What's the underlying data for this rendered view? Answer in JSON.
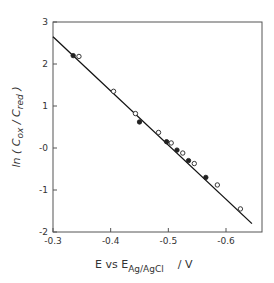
{
  "chart_data": {
    "type": "scatter",
    "title": "",
    "xlabel": "E vs E_Ag/AgCl / V",
    "xlabel_parts": {
      "main": "E  vs  E",
      "subscript": "Ag/AgCl",
      "unit": "/   V"
    },
    "ylabel": "ln ( C_ox / C_red )",
    "ylabel_parts": {
      "prefix": "ln ( C",
      "sub1": "ox",
      "mid": " / C",
      "sub2": "red",
      "suffix": " )"
    },
    "xlim": [
      -0.3,
      -0.65
    ],
    "ylim": [
      -2,
      3
    ],
    "x_ticks": [
      -0.3,
      -0.4,
      -0.5,
      -0.6
    ],
    "x_tick_labels": [
      "-0.3",
      "-0.4",
      "-0.5",
      "-0.6"
    ],
    "y_ticks": [
      3,
      2,
      1,
      0,
      -1,
      -2
    ],
    "y_tick_labels": [
      "3",
      "2",
      "1",
      "-0",
      "-1",
      "-2"
    ],
    "grid": false,
    "legend": null,
    "series": [
      {
        "name": "open circles",
        "marker": "open-circle",
        "x": [
          -0.345,
          -0.405,
          -0.443,
          -0.483,
          -0.505,
          -0.525,
          -0.545,
          -0.585,
          -0.625
        ],
        "y": [
          2.18,
          1.35,
          0.82,
          0.37,
          0.12,
          -0.12,
          -0.37,
          -0.88,
          -1.45
        ]
      },
      {
        "name": "filled circles",
        "marker": "filled-circle",
        "x": [
          -0.335,
          -0.45,
          -0.497,
          -0.515,
          -0.535,
          -0.565
        ],
        "y": [
          2.2,
          0.62,
          0.15,
          -0.05,
          -0.3,
          -0.7
        ]
      },
      {
        "name": "fit line",
        "marker": "line",
        "x": [
          -0.3,
          -0.645
        ],
        "y": [
          2.65,
          -1.8
        ]
      }
    ]
  },
  "colors": {
    "axis": "#555555",
    "line": "#111111",
    "marker": "#222222",
    "text": "#333333"
  }
}
